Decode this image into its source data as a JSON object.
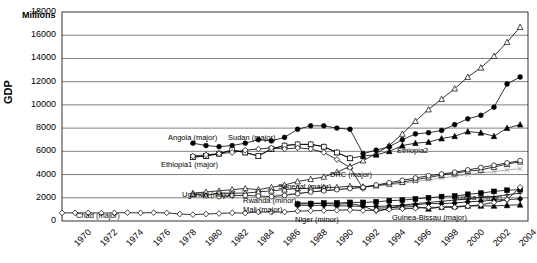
{
  "chart_data": {
    "type": "line",
    "title": "",
    "subtitle": "",
    "ylabel": "GDP",
    "units_label": "Millions",
    "xlabel": "",
    "grid": true,
    "legend_position": "inline-annotations",
    "ylim": [
      0,
      18000
    ],
    "yticks": [
      0,
      2000,
      4000,
      6000,
      8000,
      10000,
      12000,
      14000,
      16000,
      18000
    ],
    "xticks": [
      1970,
      1972,
      1974,
      1976,
      1978,
      1980,
      1982,
      1984,
      1986,
      1988,
      1990,
      1992,
      1994,
      1996,
      1998,
      2000,
      2002,
      2004
    ],
    "x": [
      1970,
      1971,
      1972,
      1973,
      1974,
      1975,
      1976,
      1977,
      1978,
      1979,
      1980,
      1981,
      1982,
      1983,
      1984,
      1985,
      1986,
      1987,
      1988,
      1989,
      1990,
      1991,
      1992,
      1993,
      1994,
      1995,
      1996,
      1997,
      1998,
      1999,
      2000,
      2001,
      2002,
      2003,
      2004,
      2005
    ],
    "series": [
      {
        "name": "Sudan (major)",
        "marker": "triangle-up-open",
        "x": [
          1980,
          1981,
          1982,
          1983,
          1984,
          1985,
          1986,
          1987,
          1988,
          1989,
          1990,
          1991,
          1992,
          1993,
          1994,
          1995,
          1996,
          1997,
          1998,
          1999,
          2000,
          2001,
          2002,
          2003,
          2004,
          2005
        ],
        "values": [
          2400,
          2500,
          2600,
          2700,
          2800,
          2700,
          2900,
          3100,
          3400,
          3600,
          3800,
          4200,
          4700,
          5200,
          5800,
          6500,
          7500,
          8600,
          9600,
          10500,
          11400,
          12400,
          13200,
          14200,
          15400,
          16700
        ]
      },
      {
        "name": "Angola (major)",
        "marker": "circle-filled",
        "x": [
          1980,
          1981,
          1982,
          1983,
          1984,
          1985,
          1986,
          1987,
          1988,
          1989,
          1990,
          1991,
          1992,
          1993,
          1994,
          1995,
          1996,
          1997,
          1998,
          1999,
          2000,
          2001,
          2002,
          2003,
          2004,
          2005
        ],
        "values": [
          6700,
          6500,
          6400,
          6500,
          6700,
          7000,
          6900,
          7200,
          7900,
          8200,
          8200,
          8000,
          7900,
          5800,
          6100,
          6400,
          7000,
          7500,
          7600,
          7800,
          8300,
          8800,
          9100,
          9800,
          11800,
          12400
        ]
      },
      {
        "name": "Ethiopia2",
        "marker": "triangle-up-filled",
        "x": [
          1980,
          1981,
          1982,
          1983,
          1984,
          1985,
          1986,
          1987,
          1988,
          1989,
          1990,
          1991,
          1992,
          1993,
          1994,
          1995,
          1996,
          1997,
          1998,
          1999,
          2000,
          2001,
          2002,
          2003,
          2004,
          2005
        ],
        "values": [
          5500,
          5600,
          5800,
          6100,
          5900,
          5600,
          6200,
          6500,
          6600,
          6600,
          6400,
          5900,
          5400,
          5600,
          5700,
          6000,
          6500,
          6700,
          6800,
          7100,
          7300,
          7700,
          7600,
          7300,
          8000,
          8300
        ]
      },
      {
        "name": "Ethiopia1 (major)",
        "marker": "square-open",
        "x": [
          1980,
          1981,
          1982,
          1983,
          1984,
          1985,
          1986,
          1987,
          1988,
          1989,
          1990,
          1991,
          1992
        ],
        "values": [
          5500,
          5600,
          5800,
          6100,
          5900,
          5600,
          6200,
          6500,
          6600,
          6600,
          6400,
          5900,
          5400
        ]
      },
      {
        "name": "DRC (major)",
        "marker": "diamond-open",
        "x": [
          1980,
          1981,
          1982,
          1983,
          1984,
          1985,
          1986,
          1987,
          1988,
          1989,
          1990,
          1991,
          1992,
          1993
        ],
        "values": [
          5600,
          5700,
          5800,
          5900,
          6100,
          6200,
          6300,
          6200,
          6300,
          6200,
          5900,
          5300,
          4600,
          2800
        ]
      },
      {
        "name": "Guinea (minor)",
        "marker": "cross",
        "x": [
          1986,
          1987,
          1988,
          1989,
          1990,
          1991,
          1992,
          1993,
          1994,
          1995,
          1996,
          1997,
          1998,
          1999,
          2000,
          2001,
          2002,
          2003,
          2004,
          2005
        ],
        "values": [
          2200,
          2300,
          2400,
          2500,
          2600,
          2700,
          2800,
          2900,
          3000,
          3100,
          3250,
          3400,
          3550,
          3700,
          3850,
          4000,
          4150,
          4250,
          4400,
          4500
        ]
      },
      {
        "name": "Senegal (major)",
        "marker": "triangle-up-open",
        "x": [
          1980,
          1981,
          1982,
          1983,
          1984,
          1985,
          1986,
          1987,
          1988,
          1989,
          1990,
          1991,
          1992,
          1993,
          1994,
          1995,
          1996,
          1997,
          1998,
          1999,
          2000,
          2001,
          2002,
          2003,
          2004,
          2005
        ],
        "values": [
          2300,
          2200,
          2400,
          2400,
          2400,
          2500,
          2600,
          2700,
          2800,
          2800,
          2900,
          2900,
          3000,
          2950,
          3050,
          3200,
          3350,
          3550,
          3750,
          3950,
          4100,
          4300,
          4400,
          4650,
          4900,
          5100
        ]
      },
      {
        "name": "Uganda (major)",
        "marker": "circle-open",
        "x": [
          1982,
          1983,
          1984,
          1985,
          1986,
          1987,
          1988,
          1989,
          1990,
          1991,
          1992,
          1993,
          1994,
          1995,
          1996,
          1997,
          1998,
          1999,
          2000,
          2001,
          2002,
          2003,
          2004,
          2005
        ],
        "values": [
          2100,
          2200,
          2200,
          2150,
          2100,
          2200,
          2350,
          2500,
          2600,
          2700,
          2800,
          2900,
          3100,
          3300,
          3500,
          3700,
          3900,
          4050,
          4200,
          4400,
          4600,
          4800,
          5000,
          5200
        ]
      },
      {
        "name": "Mali (major)",
        "marker": "square-filled",
        "x": [
          1988,
          1989,
          1990,
          1991,
          1992,
          1993,
          1994,
          1995,
          1996,
          1997,
          1998,
          1999,
          2000,
          2001,
          2002,
          2003,
          2004,
          2005
        ],
        "values": [
          1450,
          1500,
          1550,
          1550,
          1600,
          1600,
          1650,
          1750,
          1800,
          1900,
          2000,
          2100,
          2150,
          2300,
          2400,
          2550,
          2650,
          2700
        ]
      },
      {
        "name": "Rwanda (minor)",
        "marker": "plus",
        "x": [
          1988,
          1989,
          1990,
          1991,
          1992,
          1993,
          1994,
          1995,
          1996,
          1997,
          1998,
          1999,
          2000,
          2001,
          2002,
          2003,
          2004,
          2005
        ],
        "values": [
          1550,
          1550,
          1500,
          1450,
          1500,
          1300,
          800,
          1100,
          1350,
          1500,
          1600,
          1700,
          1800,
          1900,
          2050,
          2100,
          2250,
          2400
        ]
      },
      {
        "name": "Niger (minor)",
        "marker": "diamond-filled",
        "x": [
          1988,
          1989,
          1990,
          1991,
          1992,
          1993,
          1994,
          1995,
          1996,
          1997,
          1998,
          1999,
          2000,
          2001,
          2002,
          2003,
          2004,
          2005
        ],
        "values": [
          1350,
          1350,
          1350,
          1300,
          1300,
          1250,
          1250,
          1300,
          1350,
          1400,
          1500,
          1500,
          1550,
          1650,
          1700,
          1800,
          1850,
          1900
        ]
      },
      {
        "name": "Guinea-Bissau (major)",
        "marker": "triangle-up-filled",
        "x": [
          1994,
          1995,
          1996,
          1997,
          1998,
          1999,
          2000,
          2001,
          2002,
          2003,
          2004,
          2005
        ],
        "values": [
          1100,
          1150,
          1200,
          1250,
          1050,
          1200,
          1250,
          1300,
          1300,
          1300,
          1350,
          1400
        ]
      },
      {
        "name": "Chad (major)",
        "marker": "diamond-open",
        "x": [
          1970,
          1971,
          1972,
          1973,
          1974,
          1975,
          1976,
          1977,
          1978,
          1979,
          1980,
          1981,
          1982,
          1983,
          1984,
          1985,
          1986,
          1987,
          1988,
          1989,
          1990,
          1991,
          1992,
          1993,
          1994,
          1995,
          1996,
          1997,
          1998,
          1999,
          2000,
          2001,
          2002,
          2003,
          2004,
          2005
        ],
        "values": [
          700,
          700,
          700,
          680,
          700,
          720,
          700,
          720,
          700,
          600,
          550,
          600,
          650,
          700,
          680,
          780,
          760,
          780,
          850,
          880,
          900,
          930,
          960,
          900,
          930,
          1000,
          1050,
          1100,
          1180,
          1180,
          1180,
          1280,
          1400,
          1600,
          1850,
          2900
        ]
      }
    ],
    "annotations": [
      {
        "text": "Angola (major)",
        "x": 168,
        "y": 133
      },
      {
        "text": "Sudan (major)",
        "x": 228,
        "y": 133
      },
      {
        "text": "Ethiopia1 (major)",
        "x": 161,
        "y": 160
      },
      {
        "text": "Ethiopia2",
        "x": 397,
        "y": 146
      },
      {
        "text": "DRC (major)",
        "x": 330,
        "y": 170
      },
      {
        "text": "Senegal (major)",
        "x": 278,
        "y": 182
      },
      {
        "text": "Uganda (major)",
        "x": 182,
        "y": 190
      },
      {
        "text": "Guinea (minor)",
        "x": 452,
        "y": 193
      },
      {
        "text": "Rwanda (minor)",
        "x": 243,
        "y": 196
      },
      {
        "text": "Mali (major)",
        "x": 243,
        "y": 205
      },
      {
        "text": "Niger (minor)",
        "x": 295,
        "y": 215
      },
      {
        "text": "Guinea-Bissau (major)",
        "x": 392,
        "y": 213
      },
      {
        "text": "Chad (major)",
        "x": 76,
        "y": 211
      }
    ]
  },
  "colors": {
    "axis": "#000000",
    "grid": "#000000",
    "plot_bg": "#ffffff",
    "guinea_minor": "#999999"
  }
}
